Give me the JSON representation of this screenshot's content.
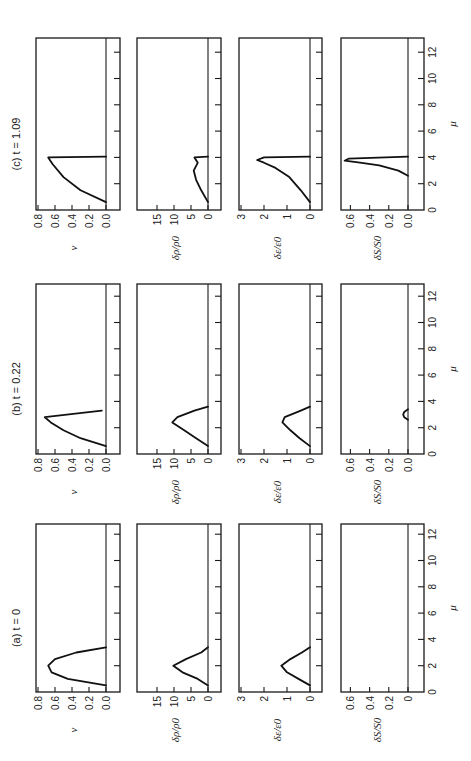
{
  "figure": {
    "orientation": "rotated 90deg counterclockwise",
    "panels_titles": [
      "(a)  t = 0",
      "(b)  t = 0.22",
      "(c)  t = 1.09"
    ],
    "x_axis_label": "μ",
    "x_ticks": [
      "0",
      "2",
      "4",
      "6",
      "8",
      "10",
      "12"
    ],
    "row_labels": {
      "v": "v",
      "rho": "δρ/ρ0",
      "eps": "δε/ε0",
      "S": "δS/S0"
    }
  },
  "chart_data": [
    {
      "type": "line",
      "title": "(a) t = 0",
      "xlabel": "μ",
      "xlim": [
        0,
        13
      ],
      "subplots": [
        {
          "ylabel": "v",
          "ylim": [
            0,
            0.8
          ],
          "yticks": [
            "0.0",
            "0.2",
            "0.4",
            "0.6",
            "0.8"
          ],
          "x": [
            0.5,
            1.0,
            1.5,
            2.0,
            2.5,
            3.0,
            3.4
          ],
          "y": [
            0.0,
            0.45,
            0.64,
            0.68,
            0.6,
            0.35,
            0.0
          ]
        },
        {
          "ylabel": "δρ/ρ0",
          "ylim": [
            0,
            17
          ],
          "yticks": [
            "0",
            "5",
            "10",
            "15"
          ],
          "x": [
            0.5,
            1.0,
            1.5,
            2.0,
            2.5,
            3.0,
            3.4
          ],
          "y": [
            0.0,
            3.0,
            7.5,
            10.2,
            6.5,
            2.0,
            0.0
          ]
        },
        {
          "ylabel": "δε/ε0",
          "ylim": [
            0,
            3
          ],
          "yticks": [
            "0",
            "1",
            "2",
            "3"
          ],
          "x": [
            0.5,
            1.0,
            1.5,
            2.0,
            2.5,
            3.0,
            3.4
          ],
          "y": [
            0.0,
            0.5,
            1.0,
            1.25,
            0.85,
            0.35,
            0.0
          ]
        },
        {
          "ylabel": "δS/S0",
          "ylim": [
            0,
            0.7
          ],
          "yticks": [
            "0",
            "0.2",
            "0.4",
            "0.6"
          ],
          "x": [
            0,
            13
          ],
          "y": [
            0,
            0
          ]
        }
      ]
    },
    {
      "type": "line",
      "title": "(b) t = 0.22",
      "xlabel": "μ",
      "xlim": [
        0,
        13
      ],
      "subplots": [
        {
          "ylabel": "v",
          "ylim": [
            0,
            0.8
          ],
          "yticks": [
            "0.0",
            "0.2",
            "0.4",
            "0.6",
            "0.8"
          ],
          "x": [
            0.6,
            1.2,
            1.8,
            2.4,
            2.8,
            3.3
          ],
          "y": [
            0.0,
            0.3,
            0.5,
            0.65,
            0.72,
            0.05
          ]
        },
        {
          "ylabel": "δρ/ρ0",
          "ylim": [
            0,
            17
          ],
          "yticks": [
            "0",
            "5",
            "10",
            "15"
          ],
          "x": [
            0.6,
            1.2,
            1.8,
            2.4,
            2.8,
            3.3,
            3.6
          ],
          "y": [
            0.0,
            3.5,
            7.0,
            10.5,
            9.0,
            4.0,
            0.0
          ]
        },
        {
          "ylabel": "δε/ε0",
          "ylim": [
            0,
            3
          ],
          "yticks": [
            "0",
            "1",
            "2",
            "3"
          ],
          "x": [
            0.6,
            1.2,
            1.8,
            2.4,
            2.8,
            3.3,
            3.6
          ],
          "y": [
            0.0,
            0.45,
            0.85,
            1.2,
            1.1,
            0.4,
            0.0
          ]
        },
        {
          "ylabel": "δS/S0",
          "ylim": [
            0,
            0.7
          ],
          "yticks": [
            "0.0",
            "0.2",
            "0.4",
            "0.6"
          ],
          "x": [
            2.6,
            2.8,
            3.0,
            3.2,
            3.4
          ],
          "y": [
            0.0,
            0.04,
            0.05,
            0.04,
            0.0
          ]
        }
      ]
    },
    {
      "type": "line",
      "title": "(c) t = 1.09",
      "xlabel": "μ",
      "xlim": [
        0,
        13
      ],
      "subplots": [
        {
          "ylabel": "v",
          "ylim": [
            0,
            0.8
          ],
          "yticks": [
            "0.0",
            "0.2",
            "0.4",
            "0.6",
            "0.8"
          ],
          "x": [
            0.6,
            1.5,
            2.5,
            3.5,
            4.0,
            4.05
          ],
          "y": [
            0.0,
            0.3,
            0.5,
            0.63,
            0.68,
            0.0
          ]
        },
        {
          "ylabel": "δρ/ρ0",
          "ylim": [
            0,
            17
          ],
          "yticks": [
            "0",
            "5",
            "10",
            "15"
          ],
          "x": [
            0.6,
            1.5,
            2.3,
            3.0,
            3.6,
            4.0,
            4.05
          ],
          "y": [
            0.0,
            2.0,
            3.5,
            4.2,
            3.0,
            4.0,
            0.0
          ]
        },
        {
          "ylabel": "δε/ε0",
          "ylim": [
            0,
            3
          ],
          "yticks": [
            "0",
            "1",
            "2",
            "3"
          ],
          "x": [
            0.6,
            1.5,
            2.5,
            3.2,
            3.6,
            3.8,
            4.0,
            4.05
          ],
          "y": [
            0.0,
            0.4,
            0.9,
            1.5,
            2.0,
            2.3,
            2.0,
            0.0
          ]
        },
        {
          "ylabel": "δS/S0",
          "ylim": [
            0,
            0.7
          ],
          "yticks": [
            "0.0",
            "0.2",
            "0.4",
            "0.6"
          ],
          "x": [
            2.6,
            3.0,
            3.4,
            3.6,
            3.75,
            3.9,
            4.05
          ],
          "y": [
            0.0,
            0.1,
            0.3,
            0.5,
            0.66,
            0.62,
            0.0
          ]
        }
      ]
    }
  ]
}
